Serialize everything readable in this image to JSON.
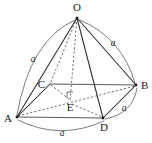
{
  "figure": {
    "stroke_colors": {
      "solid_edge": "#2b2b2b",
      "hidden_edge": "#4a4a4a",
      "arc": "#5a5a5a",
      "label": "#1a1a1a",
      "background": "#ffffff"
    },
    "vertices": [
      {
        "id": "O",
        "label": "O",
        "x": 77,
        "y": 18,
        "label_x": 77,
        "label_y": 11,
        "anchor": "middle",
        "dot": true
      },
      {
        "id": "C",
        "label": "C",
        "x": 50,
        "y": 84,
        "label_x": 44,
        "label_y": 84,
        "anchor": "end",
        "dot": false
      },
      {
        "id": "B",
        "label": "B",
        "x": 136,
        "y": 85,
        "label_x": 142,
        "label_y": 89,
        "anchor": "start",
        "dot": true
      },
      {
        "id": "A",
        "label": "A",
        "x": 17,
        "y": 117,
        "label_x": 10,
        "label_y": 121,
        "anchor": "middle",
        "dot": true
      },
      {
        "id": "D",
        "label": "D",
        "x": 103,
        "y": 118,
        "label_x": 105,
        "label_y": 130,
        "anchor": "middle",
        "dot": true
      },
      {
        "id": "E",
        "label": "E",
        "x": 70,
        "y": 102,
        "label_x": 70,
        "label_y": 110,
        "anchor": "middle",
        "dot": false
      }
    ],
    "edges_solid": [
      {
        "name": "edge-O-A",
        "from": "O",
        "to": "A"
      },
      {
        "name": "edge-O-B",
        "from": "O",
        "to": "B"
      },
      {
        "name": "edge-O-D",
        "from": "O",
        "to": "D"
      },
      {
        "name": "edge-A-C",
        "from": "A",
        "to": "C"
      },
      {
        "name": "edge-C-B",
        "from": "C",
        "to": "B"
      },
      {
        "name": "edge-A-D",
        "from": "A",
        "to": "D"
      },
      {
        "name": "edge-D-B",
        "from": "D",
        "to": "B"
      }
    ],
    "edges_hidden": [
      {
        "name": "edge-O-C",
        "from": "O",
        "to": "C"
      },
      {
        "name": "edge-O-E-altitude",
        "from": "O",
        "to": "E"
      },
      {
        "name": "edge-A-B-diagonal",
        "from": "A",
        "to": "B"
      },
      {
        "name": "edge-C-D-diagonal",
        "from": "C",
        "to": "D"
      }
    ],
    "right_angle_marker": {
      "name": "right-angle-at-E",
      "x": 67,
      "y": 92,
      "size": 6
    },
    "arcs": [
      {
        "name": "arc-O-A",
        "d": "M 75 20 Q 30 40 17 115",
        "label": "a",
        "label_x": 33,
        "label_y": 61
      },
      {
        "name": "arc-O-B",
        "d": "M 80 20 Q 122 38 135 83",
        "label": "a",
        "label_x": 113,
        "label_y": 45
      },
      {
        "name": "arc-B-D",
        "d": "M 137 88 Q 133 114 105 119",
        "label": "a",
        "label_x": 124,
        "label_y": 110
      },
      {
        "name": "arc-A-D",
        "d": "M 18 120 Q 60 141 104 121",
        "label": "a",
        "label_x": 62,
        "label_y": 134
      }
    ],
    "edge_length_symbol": "a"
  }
}
